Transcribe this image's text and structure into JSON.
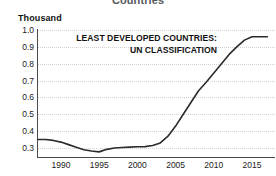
{
  "chart_data": {
    "type": "line",
    "title": "Countries",
    "subtitle": "",
    "xlabel": "",
    "ylabel": "Thousand",
    "y_unit_label": "Thousand",
    "annotations": [
      "LEAST DEVELOPED COUNTRIES:",
      "UN CLASSIFICATION"
    ],
    "grid": true,
    "legend": "none",
    "line_color": "#2b2b2b",
    "grid_color": "#d2d2d2",
    "axis_color": "#4a4a4a",
    "xlim": [
      1987,
      2018
    ],
    "ylim": [
      0.25,
      1.0
    ],
    "yticks": [
      "1.0",
      "0.9",
      "0.8",
      "0.7",
      "0.6",
      "0.5",
      "0.4",
      "0.3"
    ],
    "ytick_values": [
      1.0,
      0.9,
      0.8,
      0.7,
      0.6,
      0.5,
      0.4,
      0.3
    ],
    "xticks": [
      "1990",
      "1995",
      "2000",
      "2005",
      "2010",
      "2015"
    ],
    "xtick_values": [
      1990,
      1995,
      2000,
      2005,
      2010,
      2015
    ],
    "series": [
      {
        "name": "Least developed countries: UN classification",
        "x": [
          1987,
          1988,
          1989,
          1990,
          1991,
          1992,
          1993,
          1994,
          1995,
          1996,
          1997,
          1998,
          1999,
          2000,
          2001,
          2002,
          2003,
          2004,
          2005,
          2006,
          2007,
          2008,
          2009,
          2010,
          2011,
          2012,
          2013,
          2014,
          2015,
          2016,
          2017
        ],
        "values": [
          0.35,
          0.35,
          0.345,
          0.335,
          0.32,
          0.305,
          0.29,
          0.282,
          0.277,
          0.292,
          0.3,
          0.303,
          0.305,
          0.307,
          0.308,
          0.315,
          0.33,
          0.37,
          0.43,
          0.5,
          0.57,
          0.64,
          0.69,
          0.745,
          0.8,
          0.855,
          0.9,
          0.94,
          0.96,
          0.96,
          0.96
        ]
      }
    ]
  }
}
